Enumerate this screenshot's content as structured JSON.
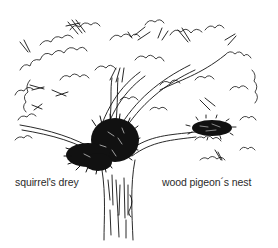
{
  "figure": {
    "style": "black ink line drawing on white",
    "colors": {
      "ink": "#111111",
      "background": "#ffffff",
      "label_text": "#2a2a2a"
    }
  },
  "labels": {
    "squirrels_drey": "squirrel's drey",
    "wood_pigeons_nest": "wood pigeon´s nest"
  }
}
